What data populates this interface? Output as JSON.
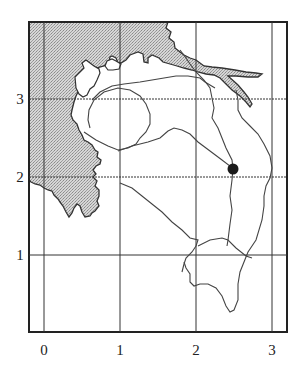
{
  "map": {
    "type": "grid-reference-map",
    "x_axis": {
      "ticks": [
        "0",
        "1",
        "2",
        "3"
      ]
    },
    "y_axis": {
      "ticks": [
        "1",
        "2",
        "3"
      ]
    },
    "features": {
      "sea_shading": "stippled gray",
      "marker": {
        "shape": "filled-circle",
        "grid_position": [
          2.5,
          2.1
        ]
      },
      "lines": [
        "coastline",
        "roads/rivers"
      ]
    },
    "colors": {
      "frame": "#222222",
      "grid": "#333333",
      "sea": "#c8c8c8",
      "line": "#444444",
      "marker": "#1a1a1a"
    }
  }
}
